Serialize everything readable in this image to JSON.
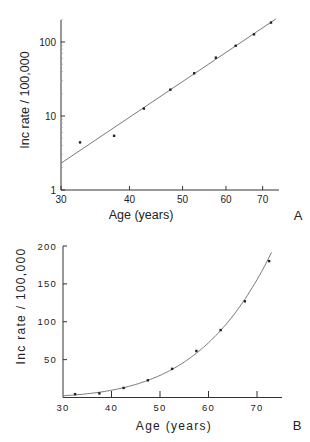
{
  "chart_data": [
    {
      "panel": "A",
      "type": "scatter",
      "title": "",
      "xlabel": "Age (years)",
      "ylabel": "Inc rate / 100,000",
      "xscale": "log",
      "yscale": "log",
      "xlim": [
        30,
        75
      ],
      "ylim": [
        1,
        205
      ],
      "xticks": [
        30,
        40,
        50,
        60,
        70
      ],
      "xtick_labels": [
        "30",
        "40",
        "50",
        "60",
        "70"
      ],
      "yticks": [
        1,
        10,
        100
      ],
      "ytick_labels": [
        "1",
        "10",
        "100"
      ],
      "grid": false,
      "legend": null,
      "series": [
        {
          "name": "observed",
          "kind": "points",
          "x": [
            32.5,
            37.5,
            42.5,
            47.5,
            52.5,
            57.5,
            62.5,
            67.5,
            72.5
          ],
          "y": [
            4.4,
            5.4,
            12.6,
            22.7,
            37.8,
            61.4,
            89,
            127,
            183
          ]
        },
        {
          "name": "fit (straight line on log-log axes)",
          "kind": "line",
          "x": [
            30,
            74
          ],
          "y": [
            2.3,
            205
          ]
        }
      ],
      "panel_label": "A"
    },
    {
      "panel": "B",
      "type": "scatter",
      "title": "",
      "xlabel": "Age (years)",
      "ylabel": "Inc rate / 100,000",
      "xscale": "linear",
      "yscale": "linear",
      "xlim": [
        30,
        75
      ],
      "ylim": [
        0,
        200
      ],
      "xticks": [
        30,
        40,
        50,
        60,
        70
      ],
      "xtick_labels": [
        "30",
        "40",
        "50",
        "60",
        "70"
      ],
      "yticks": [
        50,
        100,
        150,
        200
      ],
      "ytick_labels": [
        "50",
        "100",
        "150",
        "200"
      ],
      "grid": false,
      "legend": null,
      "series": [
        {
          "name": "observed",
          "kind": "points",
          "x": [
            32.5,
            37.5,
            42.5,
            47.5,
            52.5,
            57.5,
            62.5,
            67.5,
            72.5
          ],
          "y": [
            4.4,
            5.4,
            12.6,
            22.7,
            37.8,
            61.4,
            89,
            127,
            180
          ]
        },
        {
          "name": "fit (power-law curve)",
          "kind": "curve",
          "x": [
            30,
            35,
            40,
            45,
            50,
            55,
            60,
            65,
            70,
            73.3
          ],
          "y": [
            2.3,
            4.6,
            8.3,
            14.2,
            23.3,
            36.7,
            55.9,
            82.7,
            119,
            150
          ]
        }
      ],
      "panel_label": "B"
    }
  ],
  "labels": {
    "a": {
      "xlabel": "Age (years)",
      "ylabel": "Inc rate / 100,000",
      "panel": "A",
      "xticks": [
        "30",
        "40",
        "50",
        "60",
        "70"
      ],
      "yticks": [
        "1",
        "10",
        "100"
      ]
    },
    "b": {
      "xlabel": "Age (years)",
      "ylabel": "Inc rate / 100,000",
      "panel": "B",
      "xticks": [
        "30",
        "40",
        "50",
        "60",
        "70"
      ],
      "yticks": [
        "50",
        "100",
        "150",
        "200"
      ]
    }
  }
}
